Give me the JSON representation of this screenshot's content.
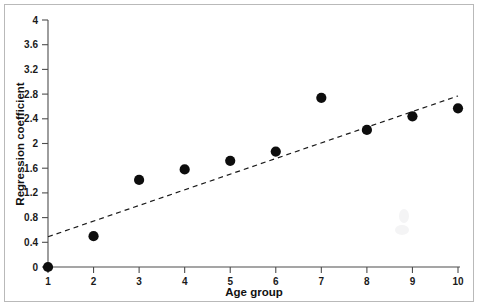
{
  "figure": {
    "background_color": "#ffffff",
    "frame_color": "#b9b9b9",
    "point_color": "#0d0d0d",
    "line_color": "#1a1a1a"
  },
  "chart_data": {
    "type": "scatter",
    "title": "",
    "subtitle": "",
    "xlabel": "Age group",
    "ylabel": "Regression coefficient",
    "xlim": [
      1,
      10
    ],
    "ylim": [
      0,
      4
    ],
    "grid": false,
    "legend": null,
    "x_ticks": [
      1,
      2,
      3,
      4,
      5,
      6,
      7,
      8,
      9,
      10
    ],
    "x_tick_labels": [
      "1",
      "2",
      "3",
      "4",
      "5",
      "6",
      "7",
      "8",
      "9",
      "10"
    ],
    "y_ticks": [
      0,
      0.4,
      0.8,
      1.2,
      1.6,
      2,
      2.4,
      2.8,
      3.2,
      3.6,
      4
    ],
    "y_tick_labels": [
      "0",
      "0.4",
      "0.8",
      "1.2",
      "1.6",
      "2",
      "2.4",
      "2.8",
      "3.2",
      "3.6",
      "4"
    ],
    "series": [
      {
        "name": "Regression coefficient by age group",
        "type": "scatter",
        "marker": "filled-circle",
        "color": "#0d0d0d",
        "x": [
          1,
          2,
          3,
          4,
          5,
          6,
          7,
          8,
          9,
          10
        ],
        "values": [
          0,
          0.5,
          1.41,
          1.58,
          1.72,
          1.87,
          2.74,
          2.22,
          2.44,
          2.57
        ]
      },
      {
        "name": "Linear trend",
        "type": "line",
        "style": "dashed",
        "color": "#1a1a1a",
        "x": [
          1,
          10
        ],
        "values": [
          0.49,
          2.77
        ]
      }
    ],
    "annotations": []
  },
  "axis": {
    "x_title": "Age group",
    "y_title": "Regression coefficient"
  }
}
